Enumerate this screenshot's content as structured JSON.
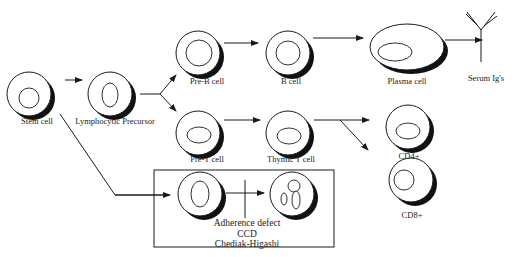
{
  "diagram": {
    "title": "",
    "colors": {
      "stroke": "#1a1a1a",
      "shadow": "#111111",
      "background": "#ffffff"
    },
    "nodes": [
      {
        "id": "stem",
        "label": "Stem cell"
      },
      {
        "id": "lymph",
        "label": "Lymphocytic Precursor"
      },
      {
        "id": "preb",
        "label": "Pre-B cell"
      },
      {
        "id": "bcell",
        "label": "B cell"
      },
      {
        "id": "plasma",
        "label": "Plasma cell"
      },
      {
        "id": "serum",
        "label": "Serum Ig's"
      },
      {
        "id": "pret",
        "label": "Pre-T cell"
      },
      {
        "id": "thymic",
        "label": "Thymic T cell"
      },
      {
        "id": "cd4",
        "label": "CD4+"
      },
      {
        "id": "cd8",
        "label": "CD8+"
      },
      {
        "id": "phago_precursor",
        "label": ""
      },
      {
        "id": "phago",
        "label": ""
      }
    ],
    "edges": [
      {
        "from": "stem",
        "to": "lymph"
      },
      {
        "from": "lymph",
        "to": "preb"
      },
      {
        "from": "lymph",
        "to": "pret"
      },
      {
        "from": "preb",
        "to": "bcell"
      },
      {
        "from": "bcell",
        "to": "plasma"
      },
      {
        "from": "plasma",
        "to": "serum"
      },
      {
        "from": "pret",
        "to": "thymic"
      },
      {
        "from": "thymic",
        "to": "cd4"
      },
      {
        "from": "thymic",
        "to": "cd8"
      },
      {
        "from": "stem",
        "to": "phago_precursor"
      },
      {
        "from": "phago_precursor",
        "to": "phago",
        "blocked": true
      }
    ],
    "box": {
      "defects": [
        "Adherence defect",
        "CCD",
        "Chediak-Higashi"
      ]
    }
  }
}
